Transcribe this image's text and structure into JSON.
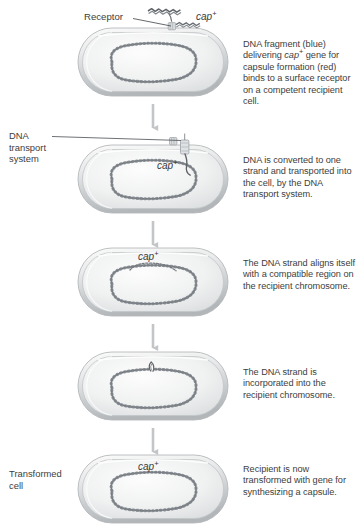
{
  "figure": {
    "background_color": "#ffffff",
    "text_color": "#404040",
    "cell_fill_light": "#f4f4f4",
    "cell_fill_shadow": "#b9bcbe",
    "chromosome_color": "#5d6166",
    "arrow_color": "#c3c6c8"
  },
  "labels": {
    "receptor": "Receptor",
    "cap_gene": "cap",
    "cap_superscript": "+",
    "dna_transport_system": "DNA\ntransport\nsystem",
    "dna_transport_line1": "DNA",
    "dna_transport_line2": "transport",
    "dna_transport_line3": "system",
    "transformed_cell_line1": "Transformed",
    "transformed_cell_line2": "cell"
  },
  "steps": [
    {
      "id": "step-1",
      "cap_label": null,
      "description_parts": [
        "DNA fragment (blue) delivering ",
        "cap",
        "+",
        " gene for capsule formation (red) binds to a surface receptor on a competent recipient cell."
      ],
      "description_plain": "DNA fragment (blue) delivering cap+ gene for capsule formation (red) binds to a surface receptor on a competent recipient cell."
    },
    {
      "id": "step-2",
      "cap_label": "cap",
      "cap_superscript": "+",
      "description_plain": "DNA is converted to one strand and transported into the cell, by the DNA transport system."
    },
    {
      "id": "step-3",
      "cap_label": "cap",
      "cap_superscript": "+",
      "description_plain": "The DNA strand aligns itself with a compatible region on the recipient chromosome."
    },
    {
      "id": "step-4",
      "cap_label": null,
      "description_plain": "The DNA strand is incorporated into the recipient chromosome."
    },
    {
      "id": "step-5",
      "cap_label": "cap",
      "cap_superscript": "+",
      "description_plain": "Recipient is now transformed with gene for synthesizing a capsule."
    }
  ],
  "icons": {
    "arrow": "down-arrow-icon",
    "cell": "bacterial-cell-icon",
    "chromosome": "circular-chromosome-icon",
    "dna_fragment": "dna-fragment-icon",
    "receptor": "receptor-icon",
    "transport_system": "dna-transport-system-icon"
  }
}
